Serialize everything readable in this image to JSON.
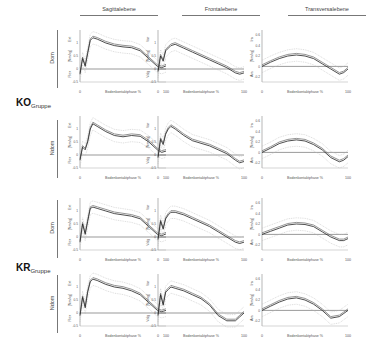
{
  "columns": [
    {
      "label": "Sagittalebene"
    },
    {
      "label": "Frontalebene"
    },
    {
      "label": "Transversalebene"
    }
  ],
  "groups": [
    {
      "label": "KO",
      "sub": "Gruppe"
    },
    {
      "label": "KR",
      "sub": "Gruppe"
    }
  ],
  "rows": [
    {
      "group": 0,
      "label": "Dom"
    },
    {
      "group": 0,
      "label": "Ndom"
    },
    {
      "group": 1,
      "label": "Dom"
    },
    {
      "group": 1,
      "label": "Ndom"
    }
  ],
  "axes": {
    "xlabel": "Bodenkontaktphase  %",
    "x_ticks": [
      "0",
      "100"
    ],
    "y_mid_label": "[Nm/kg]",
    "sagittal": {
      "top": "Ext",
      "bottom": "Flex",
      "ticks": [
        "1",
        "0.5",
        "0",
        "-0.5"
      ],
      "ylim": [
        -0.5,
        1.5
      ]
    },
    "frontal": {
      "top": "Var",
      "bottom": "Valg",
      "ticks": [
        "1",
        "0.5",
        "0",
        "-0.5"
      ],
      "ylim": [
        -0.5,
        1.5
      ]
    },
    "transversal": {
      "top": "Ira",
      "bottom": "Ara",
      "ticks": [
        "0.6",
        "0.4",
        "0.2",
        "0",
        "-0.2"
      ],
      "ylim": [
        -0.3,
        0.7
      ]
    }
  },
  "chart_data": [
    {
      "type": "line",
      "title": "KO Gruppe – Dom – Sagittalebene",
      "xlabel": "Bodenkontaktphase %",
      "ylabel": "[Nm/kg] Ext/Flex",
      "ylim": [
        -0.5,
        1.5
      ],
      "x": [
        0,
        3,
        6,
        9,
        12,
        15,
        20,
        30,
        40,
        50,
        60,
        70,
        80,
        90,
        95,
        100
      ],
      "series": [
        {
          "name": "mean",
          "values": [
            -0.2,
            0.4,
            0.1,
            0.6,
            1.1,
            1.2,
            1.15,
            1.0,
            0.9,
            0.85,
            0.82,
            0.7,
            0.4,
            0.1,
            0.05,
            0.12
          ]
        }
      ]
    },
    {
      "type": "line",
      "title": "KO Gruppe – Dom – Frontalebene",
      "xlabel": "Bodenkontaktphase %",
      "ylabel": "[Nm/kg] Var/Valg",
      "ylim": [
        -0.5,
        1.5
      ],
      "x": [
        0,
        3,
        6,
        9,
        12,
        15,
        20,
        30,
        40,
        50,
        60,
        70,
        80,
        90,
        95,
        100
      ],
      "series": [
        {
          "name": "mean",
          "values": [
            -0.1,
            0.5,
            0.3,
            0.7,
            0.8,
            0.9,
            0.95,
            0.8,
            0.65,
            0.5,
            0.35,
            0.2,
            0.05,
            -0.15,
            -0.2,
            -0.15
          ]
        }
      ]
    },
    {
      "type": "line",
      "title": "KO Gruppe – Dom – Transversalebene",
      "xlabel": "Bodenkontaktphase %",
      "ylabel": "[Nm/kg] Ira/Ara",
      "ylim": [
        -0.3,
        0.7
      ],
      "x": [
        0,
        10,
        20,
        30,
        40,
        50,
        60,
        70,
        80,
        90,
        95,
        100
      ],
      "series": [
        {
          "name": "mean",
          "values": [
            0,
            0.08,
            0.15,
            0.2,
            0.22,
            0.2,
            0.15,
            0.05,
            -0.05,
            -0.15,
            -0.12,
            -0.05
          ]
        }
      ]
    },
    {
      "type": "line",
      "title": "KO Gruppe – Ndom – Sagittalebene",
      "xlabel": "Bodenkontaktphase %",
      "ylabel": "[Nm/kg] Ext/Flex",
      "ylim": [
        -0.5,
        1.5
      ],
      "x": [
        0,
        3,
        6,
        9,
        12,
        15,
        20,
        30,
        40,
        50,
        60,
        70,
        80,
        90,
        95,
        100
      ],
      "series": [
        {
          "name": "mean",
          "values": [
            -0.2,
            0.3,
            0.2,
            0.5,
            1.0,
            1.2,
            1.1,
            0.9,
            0.75,
            0.7,
            0.75,
            0.72,
            0.5,
            0.2,
            0.1,
            0.15
          ]
        }
      ]
    },
    {
      "type": "line",
      "title": "KO Gruppe – Ndom – Frontalebene",
      "xlabel": "Bodenkontaktphase %",
      "ylabel": "[Nm/kg] Var/Valg",
      "ylim": [
        -0.5,
        1.5
      ],
      "x": [
        0,
        3,
        6,
        9,
        12,
        15,
        20,
        30,
        40,
        50,
        60,
        70,
        80,
        90,
        95,
        100
      ],
      "series": [
        {
          "name": "mean",
          "values": [
            -0.1,
            0.6,
            0.4,
            0.8,
            1.0,
            1.1,
            1.0,
            0.75,
            0.55,
            0.45,
            0.35,
            0.2,
            0.05,
            -0.2,
            -0.3,
            -0.25
          ]
        }
      ]
    },
    {
      "type": "line",
      "title": "KO Gruppe – Ndom – Transversalebene",
      "xlabel": "Bodenkontaktphase %",
      "ylabel": "[Nm/kg] Ira/Ara",
      "ylim": [
        -0.3,
        0.7
      ],
      "x": [
        0,
        10,
        20,
        30,
        40,
        50,
        60,
        70,
        80,
        90,
        95,
        100
      ],
      "series": [
        {
          "name": "mean",
          "values": [
            0,
            0.08,
            0.17,
            0.22,
            0.24,
            0.22,
            0.15,
            0.05,
            -0.1,
            -0.18,
            -0.15,
            -0.08
          ]
        }
      ]
    },
    {
      "type": "line",
      "title": "KR Gruppe – Dom – Sagittalebene",
      "xlabel": "Bodenkontaktphase %",
      "ylabel": "[Nm/kg] Ext/Flex",
      "ylim": [
        -0.5,
        1.5
      ],
      "x": [
        0,
        3,
        6,
        9,
        12,
        15,
        20,
        30,
        40,
        50,
        60,
        70,
        80,
        90,
        95,
        100
      ],
      "series": [
        {
          "name": "mean",
          "values": [
            -0.2,
            0.5,
            0.1,
            0.6,
            1.1,
            1.15,
            1.1,
            1.0,
            0.9,
            0.85,
            0.8,
            0.7,
            0.4,
            0.1,
            0.05,
            0.12
          ]
        }
      ]
    },
    {
      "type": "line",
      "title": "KR Gruppe – Dom – Frontalebene",
      "xlabel": "Bodenkontaktphase %",
      "ylabel": "[Nm/kg] Var/Valg",
      "ylim": [
        -0.5,
        1.5
      ],
      "x": [
        0,
        3,
        6,
        9,
        12,
        15,
        20,
        30,
        40,
        50,
        60,
        70,
        80,
        90,
        95,
        100
      ],
      "series": [
        {
          "name": "mean",
          "values": [
            -0.1,
            0.6,
            0.3,
            0.7,
            0.85,
            0.95,
            0.95,
            0.85,
            0.7,
            0.55,
            0.4,
            0.2,
            0.0,
            -0.2,
            -0.25,
            -0.2
          ]
        }
      ]
    },
    {
      "type": "line",
      "title": "KR Gruppe – Dom – Transversalebene",
      "xlabel": "Bodenkontaktphase %",
      "ylabel": "[Nm/kg] Ira/Ara",
      "ylim": [
        -0.3,
        0.7
      ],
      "x": [
        0,
        10,
        20,
        30,
        40,
        50,
        60,
        70,
        80,
        90,
        95,
        100
      ],
      "series": [
        {
          "name": "mean",
          "values": [
            0,
            0.06,
            0.12,
            0.18,
            0.2,
            0.19,
            0.15,
            0.05,
            -0.05,
            -0.12,
            -0.12,
            -0.08
          ]
        }
      ]
    },
    {
      "type": "line",
      "title": "KR Gruppe – Ndom – Sagittalebene",
      "xlabel": "Bodenkontaktphase %",
      "ylabel": "[Nm/kg] Ext/Flex",
      "ylim": [
        -0.5,
        1.5
      ],
      "x": [
        0,
        3,
        6,
        9,
        12,
        15,
        20,
        30,
        40,
        50,
        60,
        70,
        80,
        90,
        95,
        100
      ],
      "series": [
        {
          "name": "mean",
          "values": [
            -0.1,
            0.6,
            0.2,
            0.8,
            1.2,
            1.3,
            1.25,
            1.1,
            1.0,
            0.95,
            0.85,
            0.7,
            0.4,
            0.1,
            0.05,
            0.1
          ]
        }
      ]
    },
    {
      "type": "line",
      "title": "KR Gruppe – Ndom – Frontalebene",
      "xlabel": "Bodenkontaktphase %",
      "ylabel": "[Nm/kg] Var/Valg",
      "ylim": [
        -0.5,
        1.5
      ],
      "x": [
        0,
        3,
        6,
        9,
        12,
        15,
        20,
        30,
        40,
        50,
        60,
        70,
        80,
        90,
        95,
        100
      ],
      "series": [
        {
          "name": "mean",
          "values": [
            -0.1,
            0.7,
            0.3,
            0.8,
            0.9,
            1.0,
            0.95,
            0.85,
            0.7,
            0.55,
            0.3,
            -0.1,
            -0.3,
            -0.3,
            -0.15,
            0.0
          ]
        }
      ]
    },
    {
      "type": "line",
      "title": "KR Gruppe – Ndom – Transversalebene",
      "xlabel": "Bodenkontaktphase %",
      "ylabel": "[Nm/kg] Ira/Ara",
      "ylim": [
        -0.3,
        0.7
      ],
      "x": [
        0,
        10,
        20,
        30,
        40,
        50,
        60,
        70,
        80,
        90,
        95,
        100
      ],
      "series": [
        {
          "name": "mean",
          "values": [
            0,
            0.08,
            0.16,
            0.22,
            0.24,
            0.2,
            0.12,
            0.0,
            -0.15,
            -0.12,
            -0.06,
            0.0
          ]
        }
      ]
    }
  ]
}
